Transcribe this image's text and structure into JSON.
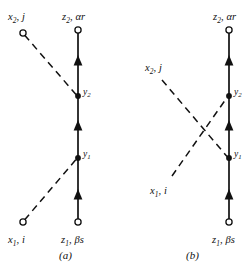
{
  "figure": {
    "background_color": "#ffffff",
    "ink_color": "#111111",
    "panels": [
      {
        "id": "a",
        "caption": "(a)",
        "caption_x": 59,
        "caption_y": 258,
        "propagator": {
          "name": "vertical-propagator",
          "x": 78,
          "y_bottom": 222,
          "y_top": 30,
          "bottom_endpoint_label": {
            "base": "z",
            "sub": "1",
            "rest": ", βs",
            "text": "z₁, βs",
            "x": 62,
            "y": 240
          },
          "top_endpoint_label": {
            "base": "z",
            "sub": "2",
            "rest": ", αr",
            "text": "z₂, αr",
            "x": 62,
            "y": 20
          },
          "arrow_positions_y": [
            196,
            127,
            62
          ],
          "vertices": [
            {
              "name": "vertex-y1",
              "label_base": "y",
              "label_sub": "1",
              "text": "y₁",
              "x": 78,
              "y": 158,
              "label_x": 83,
              "label_y": 157
            },
            {
              "name": "vertex-y2",
              "label_base": "y",
              "label_sub": "2",
              "text": "y₂",
              "x": 78,
              "y": 96,
              "label_x": 83,
              "label_y": 95
            }
          ]
        },
        "external_lines": [
          {
            "name": "external-line-x2j",
            "style": "dashed",
            "from_x": 23,
            "from_y": 33,
            "to_x": 78,
            "to_y": 96,
            "endpoint_label": {
              "base": "x",
              "sub": "2",
              "rest": ", j",
              "text": "x₂, j",
              "x": 8,
              "y": 20
            }
          },
          {
            "name": "external-line-x1i",
            "style": "dashed",
            "from_x": 23,
            "from_y": 222,
            "to_x": 78,
            "to_y": 158,
            "endpoint_label": {
              "base": "x",
              "sub": "1",
              "rest": ", i",
              "text": "x₁, i",
              "x": 8,
              "y": 240
            }
          }
        ]
      },
      {
        "id": "b",
        "caption": "(b)",
        "caption_x": 186,
        "caption_y": 258,
        "propagator": {
          "name": "vertical-propagator",
          "x": 229,
          "y_bottom": 222,
          "y_top": 30,
          "bottom_endpoint_label": {
            "base": "z",
            "sub": "1",
            "rest": ", βs",
            "text": "z₁, βs",
            "x": 213,
            "y": 240
          },
          "top_endpoint_label": {
            "base": "z",
            "sub": "2",
            "rest": ", αr",
            "text": "z₂, αr",
            "x": 213,
            "y": 20
          },
          "arrow_positions_y": [
            196,
            127,
            62
          ],
          "vertices": [
            {
              "name": "vertex-y1",
              "label_base": "y",
              "label_sub": "1",
              "text": "y₁",
              "x": 229,
              "y": 158,
              "label_x": 234,
              "label_y": 157
            },
            {
              "name": "vertex-y2",
              "label_base": "y",
              "label_sub": "2",
              "text": "y₂",
              "x": 229,
              "y": 96,
              "label_x": 234,
              "label_y": 95
            }
          ]
        },
        "external_lines": [
          {
            "name": "external-line-x2j",
            "style": "dashed",
            "from_x": 162,
            "from_y": 80,
            "to_x": 229,
            "to_y": 158,
            "endpoint_label": {
              "base": "x",
              "sub": "2",
              "rest": ", j",
              "text": "x₂, j",
              "x": 145,
              "y": 71
            }
          },
          {
            "name": "external-line-x1i",
            "style": "dashed",
            "from_x": 172,
            "from_y": 176,
            "to_x": 229,
            "to_y": 96,
            "endpoint_label": {
              "base": "x",
              "sub": "1",
              "rest": ", i",
              "text": "x₁, i",
              "x": 152,
              "y": 190
            }
          }
        ]
      }
    ]
  }
}
